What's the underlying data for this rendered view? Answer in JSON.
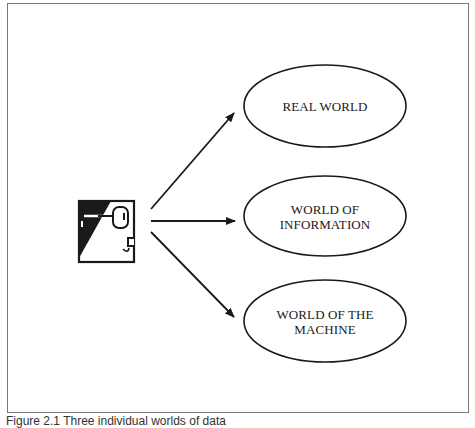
{
  "figure": {
    "caption": "Figure 2.1   Three individual worlds of data",
    "observer": {
      "icon": "person-with-glasses-icon"
    },
    "worlds": [
      {
        "id": "real",
        "line1": "REAL WORLD",
        "line2": ""
      },
      {
        "id": "information",
        "line1": "WORLD OF",
        "line2": "INFORMATION"
      },
      {
        "id": "machine",
        "line1": "WORLD OF THE",
        "line2": "MACHINE"
      }
    ],
    "arrows": [
      {
        "from": "observer",
        "to": "real"
      },
      {
        "from": "observer",
        "to": "information"
      },
      {
        "from": "observer",
        "to": "machine"
      }
    ],
    "colors": {
      "stroke": "#1a1a1a",
      "frame": "#777777",
      "background": "#ffffff"
    }
  }
}
